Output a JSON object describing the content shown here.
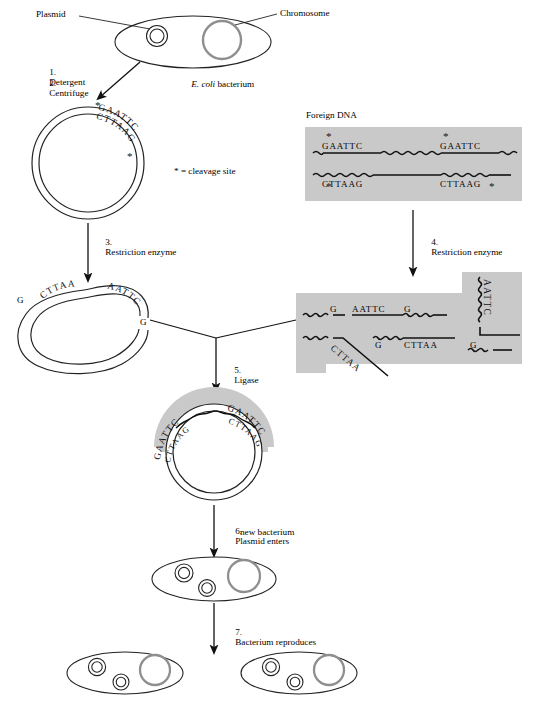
{
  "figure": {
    "legend": "* = cleavage site",
    "colors": {
      "shading": "#c9c9c9",
      "chromosome_stroke": "#8f8f8f",
      "line": "#1a1a1a",
      "background": "#ffffff"
    }
  },
  "labels": {
    "plasmid": "Plasmid",
    "chromosome": "Chromosome",
    "ecoli": "E. coli",
    "ecoli_rest": " bacterium",
    "foreign_dna": "Foreign DNA"
  },
  "steps": [
    {
      "num": "1.",
      "text": "Detergent"
    },
    {
      "num": "2.",
      "text": "Centrifuge"
    },
    {
      "num": "3.",
      "text": "Restriction enzyme"
    },
    {
      "num": "4.",
      "text": "Restriction enzyme"
    },
    {
      "num": "5.",
      "text": "Ligase"
    },
    {
      "num": "6.",
      "text": "Plasmid enters",
      "text2": "new bacterium"
    },
    {
      "num": "7.",
      "text": "Bacterium reproduces"
    }
  ],
  "sequences": {
    "top_strand": "GAATTC",
    "bottom_strand": "CTTAAG",
    "sticky_top_left": "G",
    "sticky_top_right": "AATTC",
    "sticky_bottom_left": "CTTAA",
    "sticky_bottom_right": "G",
    "star": "*"
  },
  "plasmid_intact": {
    "top": "GAATTC",
    "bottom": "CTTAAG",
    "star_top": "*",
    "star_bottom": "*"
  },
  "plasmid_cut": {
    "left_g": "G",
    "left_cttaa": "CTTAA",
    "right_aattc": "AATTC",
    "right_g": "G"
  },
  "foreign_dna_box": {
    "top_left_seq": "GAATTC",
    "top_right_seq": "GAATTC",
    "bottom_left_seq": "CTTAAG",
    "bottom_right_seq": "CTTAAG",
    "stars": [
      "*",
      "*",
      "*",
      "*"
    ]
  },
  "fragments_box": {
    "row1": [
      "G",
      "AATTC",
      "G"
    ],
    "row2": [
      "CTTAA",
      "G",
      "CTTAA",
      "G"
    ],
    "vertical_seq": "AATTC",
    "diagonal_seq": "CTTAA"
  },
  "recombinant_plasmid": {
    "left_top": "GAATTC",
    "left_bottom": "CTTAAG",
    "right_top": "GAATTC",
    "right_bottom": "CTTAAG"
  }
}
